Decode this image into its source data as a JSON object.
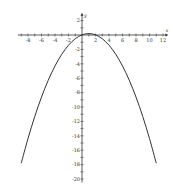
{
  "chart_data": {
    "type": "line",
    "title": "",
    "xlabel": "x",
    "ylabel": "y",
    "xlim": [
      -9.5,
      12.5
    ],
    "ylim": [
      -20.5,
      2.8
    ],
    "grid": false,
    "x_ticks": [
      -8,
      -6,
      -4,
      -2,
      2,
      4,
      6,
      8,
      10,
      12
    ],
    "x_ticks_minor_step": 1,
    "y_ticks": [
      2,
      -2,
      -4,
      -6,
      -8,
      -10,
      -12,
      -14,
      -16,
      -18,
      -20
    ],
    "y_ticks_minor_step": 1,
    "x_tick_labels": [
      "-8",
      "-6",
      "-4",
      "-2",
      "2",
      "4",
      "6",
      "8",
      "10",
      "12"
    ],
    "y_tick_labels": [
      "2",
      "-2",
      "-4",
      "-6",
      "-8",
      "-10",
      "-12",
      "-14",
      "-16",
      "-18",
      "-20"
    ],
    "series": [
      {
        "name": "parabola",
        "note": "Points sampled from a fitted curve y ≈ -0.18(x-1)^2 + 0.2; estimated from the image, not read directly, as the fit conflicts with the apparent y-intercept near -1",
        "x": [
          -9,
          -8,
          -7,
          -6,
          -5,
          -4,
          -3,
          -2,
          -1,
          0,
          1,
          2,
          3,
          4,
          5,
          6,
          7,
          8,
          9,
          10,
          11
        ],
        "y": [
          -17.8,
          -14.38,
          -11.32,
          -8.62,
          -6.28,
          -4.3,
          -2.68,
          -1.42,
          -0.52,
          0.02,
          0.2,
          0.02,
          -0.52,
          -1.42,
          -2.68,
          -4.3,
          -6.28,
          -8.62,
          -11.32,
          -14.38,
          -17.8
        ]
      }
    ]
  }
}
